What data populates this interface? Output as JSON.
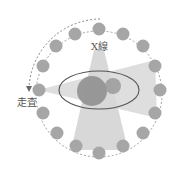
{
  "diagram": {
    "labels": {
      "xray": "X線",
      "scan": "走査"
    },
    "colors": {
      "bead": "#a8a8a8",
      "beam": "#d6d6d6",
      "ellipse_stroke": "#555555",
      "inner_object": "#8a8a8a",
      "dashed": "#777777"
    },
    "ring": {
      "cx": 99,
      "cy": 94,
      "r": 63,
      "bead_count": 16,
      "bead_r": 6.5
    },
    "body_ellipse": {
      "cx": 99,
      "cy": 90,
      "rx": 40,
      "ry": 19
    },
    "objects": [
      {
        "name": "large-object",
        "cx": 92,
        "cy": 91,
        "r": 15
      },
      {
        "name": "small-object",
        "cx": 113,
        "cy": 86,
        "r": 8
      }
    ]
  }
}
